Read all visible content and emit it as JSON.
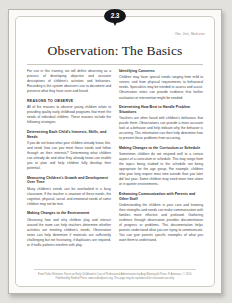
{
  "document": {
    "badge_number": "2.3",
    "corner_label": "Obs. Unit, Mod user",
    "title": "Observation: The Basics",
    "footer_line1": "From Public Relations: Focus on Early Childhood in Care of Professional Administration by Angi Mooring de Perez, F. Antonacci, © 2010.",
    "footer_line2": "Published by Redleaf Press, www.redleafpress.org. This page may be reproduced for classroom use only."
  },
  "left_column": {
    "intro": "For use in this training, we will define observing as a process of developing objective and accurate descriptions of children's activities and behaviors. Recording is the system observers use to document and preserve what they have seen and heard.",
    "sections": [
      {
        "heading": "REASONS TO OBSERVE",
        "caps": true,
        "paragraphs": [
          "All of the reasons to observe young children relate to providing quality early childhood programs that meet the needs of individual children. These reasons include the following strategies."
        ]
      },
      {
        "heading": "Determining Each Child's Interests, Skills, and Needs",
        "caps": false,
        "paragraphs": [
          "If you do not know what your children already know, like, and need, how can you meet those needs and follow through on their interests? Determining what children can already do and what they already know can enable you to plan and help children fully develop their potential."
        ]
      },
      {
        "heading": "Measuring Children's Growth and Development Over Time",
        "caps": false,
        "paragraphs": [
          "Many children's needs can be overlooked in a busy classroom. If the teacher is unaware of these needs, the cognitive, physical, social, and emotional needs of some children may not be met."
        ]
      },
      {
        "heading": "Making Changes to the Environment",
        "caps": false,
        "paragraphs": [
          "Observing how and why children play and interact around the room can help teachers determine whether activities are meeting children's needs. Observation notes can help determine if materials are sufficiently challenging but not frustrating, if duplicates are required, or if traffic patterns interfere with play."
        ]
      }
    ]
  },
  "right_column": {
    "sections": [
      {
        "heading": "Identifying Concerns",
        "caps": false,
        "paragraphs": [
          "Children may have special needs ranging from mild to severe, and from physical requirements to behavioral needs. Specialists may be needed to assess and assist. Observation notes can provide evidence that further evaluation or intervention might be needed."
        ]
      },
      {
        "heading": "Determining How Best to Handle Problem Situations",
        "caps": false,
        "paragraphs": [
          "Teachers are often faced with children's behaviors that puzzle them. Observations can provide a more accurate look at a behavior and help indicate why the behavior is occurring. This information can then help determine how to prevent those problems from occurring."
        ]
      },
      {
        "heading": "Making Changes to the Curriculum or Schedule",
        "caps": false,
        "paragraphs": [
          "Sometimes children do not respond well to a certain aspect of a curriculum or schedule. This may range from the topics being studied to the schedule not being appropriate for the age group. For example, children who year long require most time outside than you later did last year. Some children may need more time alone or in quieter environments."
        ]
      },
      {
        "heading": "Enhancing Communication with Parents and Other Staff",
        "caps": false,
        "paragraphs": [
          "Understanding the children in your care and knowing their strengths and needs can make communication with families more effective and profound. Gathering evidence through observation provides documentation of progress or problems. This documentation helps parents understand what you are trying to communicate. You can give parents specific examples of what you want them to understand."
        ]
      }
    ]
  }
}
